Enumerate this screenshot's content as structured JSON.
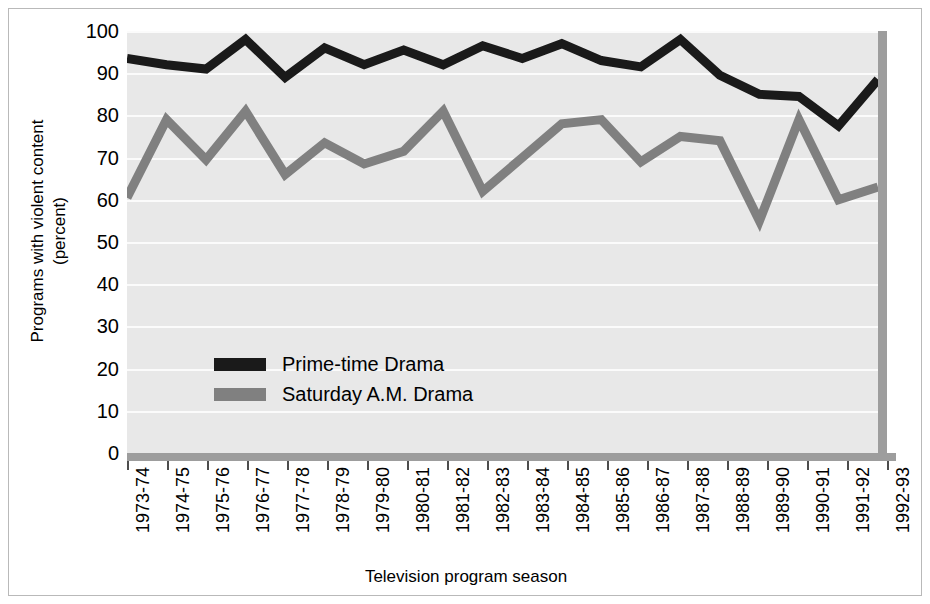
{
  "chart_data": {
    "type": "line",
    "title": "",
    "xlabel": "Television program season",
    "ylabel_line1": "Programs with violent content",
    "ylabel_line2": "(percent)",
    "ylim": [
      0,
      100
    ],
    "yticks": [
      100,
      90,
      80,
      70,
      60,
      50,
      40,
      30,
      20,
      10,
      0
    ],
    "grid": true,
    "legend_position": "inside-center-left",
    "categories": [
      "1973-74",
      "1974-75",
      "1975-76",
      "1976-77",
      "1977-78",
      "1978-79",
      "1979-80",
      "1980-81",
      "1981-82",
      "1982-83",
      "1983-84",
      "1984-85",
      "1985-86",
      "1986-87",
      "1987-88",
      "1988-89",
      "1989-90",
      "1990-91",
      "1991-92",
      "1992-93"
    ],
    "series": [
      {
        "name": "Prime-time Drama",
        "color": "#1a1a1a",
        "values": [
          93.5,
          92.0,
          91.0,
          98.0,
          89.0,
          96.0,
          92.0,
          95.5,
          92.0,
          96.5,
          93.5,
          97.0,
          93.0,
          91.5,
          98.0,
          89.5,
          85.0,
          84.5,
          77.5,
          88.5
        ]
      },
      {
        "name": "Saturday A.M. Drama",
        "color": "#808080",
        "values": [
          60.5,
          79.0,
          69.5,
          81.0,
          66.0,
          73.5,
          68.5,
          71.5,
          81.0,
          62.0,
          70.0,
          78.0,
          79.0,
          69.0,
          75.0,
          74.0,
          55.0,
          79.0,
          60.0,
          63.0
        ]
      }
    ]
  }
}
